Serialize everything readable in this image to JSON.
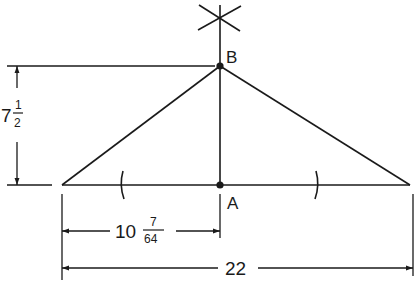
{
  "diagram": {
    "type": "geometric-construction",
    "points": {
      "B": {
        "label": "B"
      },
      "A": {
        "label": "A"
      }
    },
    "dimensions": {
      "height": {
        "whole": "7",
        "num": "1",
        "den": "2"
      },
      "half_base": {
        "whole": "10",
        "num": "7",
        "den": "64"
      },
      "base": {
        "value": "22"
      }
    },
    "colors": {
      "line": "#1a1a1a",
      "background": "#ffffff"
    }
  }
}
